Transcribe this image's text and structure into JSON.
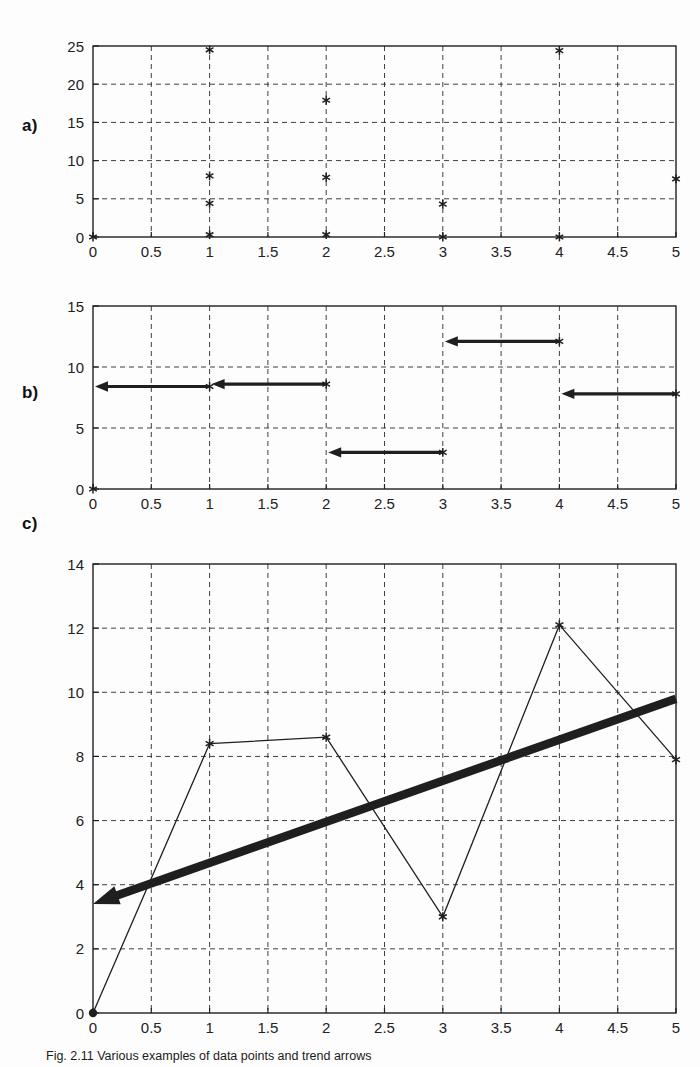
{
  "figure": {
    "panel_labels": {
      "a": "a)",
      "b": "b)",
      "c": "c)"
    },
    "caption_prefix": "Fig. 2.11",
    "caption_text": "Fig. 2.11 Various examples of data points and trend arrows"
  },
  "chart_data": [
    {
      "id": "panel-a",
      "type": "scatter",
      "title": "",
      "xlabel": "",
      "ylabel": "",
      "xlim": [
        0,
        5
      ],
      "ylim": [
        0,
        25
      ],
      "xticks": [
        0,
        0.5,
        1,
        1.5,
        2,
        2.5,
        3,
        3.5,
        4,
        4.5,
        5
      ],
      "xticklabels": [
        "0",
        "0.5",
        "1",
        "1.5",
        "2",
        "2.5",
        "3",
        "3.5",
        "4",
        "4.5",
        "5"
      ],
      "yticks": [
        0,
        5,
        10,
        15,
        20,
        25
      ],
      "yticklabels": [
        "0",
        "5",
        "10",
        "15",
        "20",
        "25"
      ],
      "grid": true,
      "grid_style": "dashed",
      "marker": "asterisk",
      "legend": "none",
      "points": [
        {
          "x": 0,
          "y": 0
        },
        {
          "x": 1,
          "y": 0.3
        },
        {
          "x": 1,
          "y": 4.4
        },
        {
          "x": 1,
          "y": 8.0
        },
        {
          "x": 1,
          "y": 24.5
        },
        {
          "x": 2,
          "y": 0.3
        },
        {
          "x": 2,
          "y": 7.8
        },
        {
          "x": 2,
          "y": 17.9
        },
        {
          "x": 3,
          "y": 0
        },
        {
          "x": 3,
          "y": 4.3
        },
        {
          "x": 4,
          "y": 0
        },
        {
          "x": 4,
          "y": 24.4
        },
        {
          "x": 5,
          "y": 7.6
        }
      ]
    },
    {
      "id": "panel-b",
      "type": "scatter",
      "title": "",
      "xlabel": "",
      "ylabel": "",
      "xlim": [
        0,
        5
      ],
      "ylim": [
        0,
        15
      ],
      "xticks": [
        0,
        0.5,
        1,
        1.5,
        2,
        2.5,
        3,
        3.5,
        4,
        4.5,
        5
      ],
      "xticklabels": [
        "0",
        "0.5",
        "1",
        "1.5",
        "2",
        "2.5",
        "3",
        "3.5",
        "4",
        "4.5",
        "5"
      ],
      "yticks": [
        0,
        5,
        10,
        15
      ],
      "yticklabels": [
        "0",
        "5",
        "10",
        "15"
      ],
      "grid": true,
      "grid_style": "dashed",
      "marker": "asterisk",
      "legend": "none",
      "points": [
        {
          "x": 0,
          "y": 0
        },
        {
          "x": 1,
          "y": 8.4
        },
        {
          "x": 2,
          "y": 8.6
        },
        {
          "x": 3,
          "y": 3.0
        },
        {
          "x": 4,
          "y": 12.1
        },
        {
          "x": 5,
          "y": 7.8
        }
      ],
      "arrows": [
        {
          "x_from": 1,
          "x_to": 0,
          "y": 8.4,
          "direction": "left"
        },
        {
          "x_from": 2,
          "x_to": 1,
          "y": 8.6,
          "direction": "left"
        },
        {
          "x_from": 3,
          "x_to": 2,
          "y": 3.0,
          "direction": "left"
        },
        {
          "x_from": 4,
          "x_to": 3,
          "y": 12.1,
          "direction": "left"
        },
        {
          "x_from": 5,
          "x_to": 4,
          "y": 7.8,
          "direction": "left"
        }
      ]
    },
    {
      "id": "panel-c",
      "type": "line",
      "title": "",
      "xlabel": "",
      "ylabel": "",
      "xlim": [
        0,
        5
      ],
      "ylim": [
        0,
        14
      ],
      "xticks": [
        0,
        0.5,
        1,
        1.5,
        2,
        2.5,
        3,
        3.5,
        4,
        4.5,
        5
      ],
      "xticklabels": [
        "0",
        "0.5",
        "1",
        "1.5",
        "2",
        "2.5",
        "3",
        "3.5",
        "4",
        "4.5",
        "5"
      ],
      "yticks": [
        0,
        2,
        4,
        6,
        8,
        10,
        12,
        14
      ],
      "yticklabels": [
        "0",
        "2",
        "4",
        "6",
        "8",
        "10",
        "12",
        "14"
      ],
      "grid": true,
      "grid_style": "dashed",
      "marker": "asterisk",
      "legend": "none",
      "series": [
        {
          "name": "data",
          "x": [
            0,
            1,
            2,
            3,
            4,
            5
          ],
          "values": [
            0,
            8.4,
            8.6,
            3.0,
            12.1,
            7.9
          ]
        }
      ],
      "trend_arrow": {
        "name": "trend",
        "x_from": 5,
        "y_from": 9.8,
        "x_to": 0,
        "y_to": 3.4,
        "direction": "left",
        "style": "thick"
      }
    }
  ]
}
